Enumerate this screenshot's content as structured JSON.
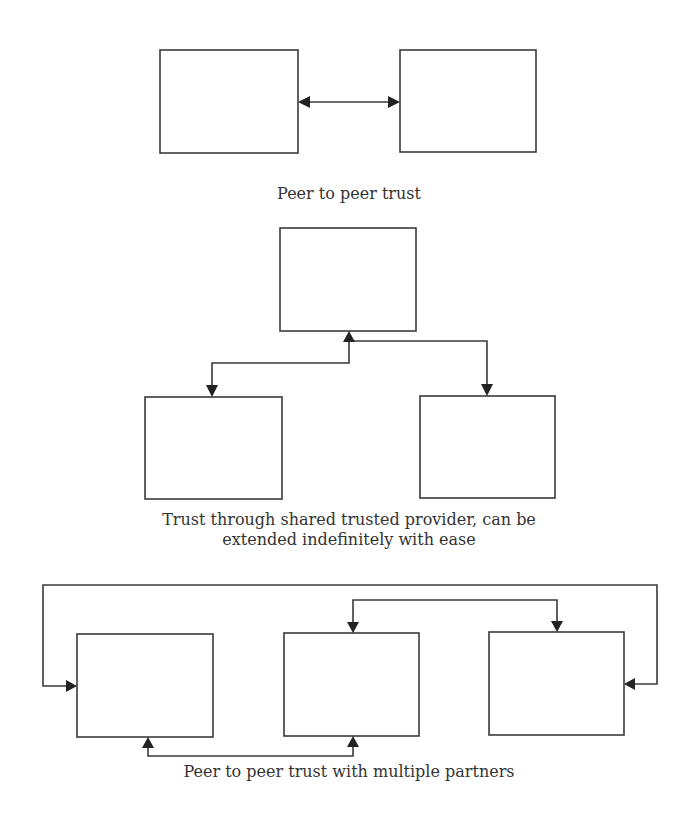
{
  "colors": {
    "stroke": "#3a3a3a",
    "arrowhead": "#222222",
    "text": "#333333",
    "background": "#ffffff"
  },
  "panels": [
    {
      "id": "peer-to-peer",
      "caption": "Peer to peer trust",
      "nodes": [
        {
          "id": "p1-left",
          "x": 160,
          "y": 50,
          "w": 138,
          "h": 103
        },
        {
          "id": "p1-right",
          "x": 400,
          "y": 50,
          "w": 136,
          "h": 102
        }
      ],
      "edges": [
        {
          "from": "p1-left",
          "to": "p1-right",
          "type": "bidirectional"
        }
      ]
    },
    {
      "id": "shared-provider",
      "caption_lines": [
        "Trust through shared trusted provider, can be",
        "extended indefinitely with ease"
      ],
      "nodes": [
        {
          "id": "p2-provider",
          "x": 280,
          "y": 228,
          "w": 136,
          "h": 103
        },
        {
          "id": "p2-left",
          "x": 145,
          "y": 397,
          "w": 137,
          "h": 102
        },
        {
          "id": "p2-right",
          "x": 420,
          "y": 396,
          "w": 135,
          "h": 102
        }
      ],
      "edges": [
        {
          "from": "p2-provider",
          "to": "p2-left",
          "type": "bidirectional"
        },
        {
          "from": "p2-provider",
          "to": "p2-right",
          "type": "bidirectional"
        }
      ]
    },
    {
      "id": "multiple-partners",
      "caption": "Peer to peer trust with multiple partners",
      "nodes": [
        {
          "id": "p3-a",
          "x": 77,
          "y": 634,
          "w": 136,
          "h": 103
        },
        {
          "id": "p3-b",
          "x": 284,
          "y": 633,
          "w": 135,
          "h": 103
        },
        {
          "id": "p3-c",
          "x": 489,
          "y": 632,
          "w": 135,
          "h": 103
        }
      ],
      "edges": [
        {
          "from": "p3-a",
          "to": "p3-c",
          "type": "bidirectional",
          "route": "outer-top"
        },
        {
          "from": "p3-b",
          "to": "p3-c",
          "type": "bidirectional",
          "route": "inner-top"
        },
        {
          "from": "p3-a",
          "to": "p3-b",
          "type": "bidirectional",
          "route": "bottom"
        }
      ]
    }
  ]
}
